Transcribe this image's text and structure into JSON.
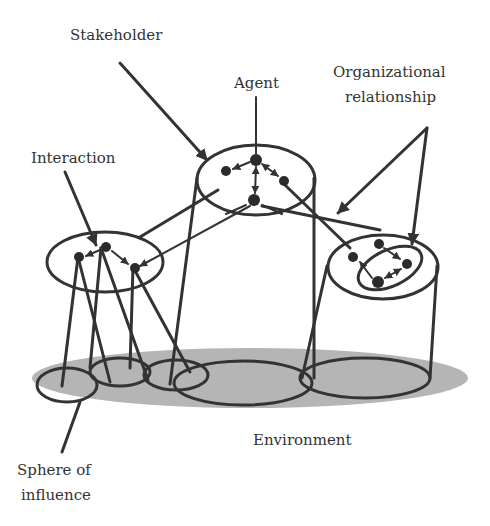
{
  "diagram": {
    "type": "multi-agent system concept diagram",
    "labels": {
      "stakeholder": "Stakeholder",
      "agent": "Agent",
      "organizational_relationship_line1": "Organizational",
      "organizational_relationship_line2": "relationship",
      "interaction": "Interaction",
      "environment": "Environment",
      "sphere_of_influence_line1": "Sphere of",
      "sphere_of_influence_line2": "influence"
    },
    "colors": {
      "line": "#333333",
      "environment_fill": "#b8b8b8",
      "background": "#ffffff"
    },
    "groups": [
      {
        "name": "top-organization",
        "agents": 4
      },
      {
        "name": "left-organization",
        "agents": 3
      },
      {
        "name": "right-organization",
        "agents": 3,
        "has_inner_group": true
      }
    ]
  }
}
